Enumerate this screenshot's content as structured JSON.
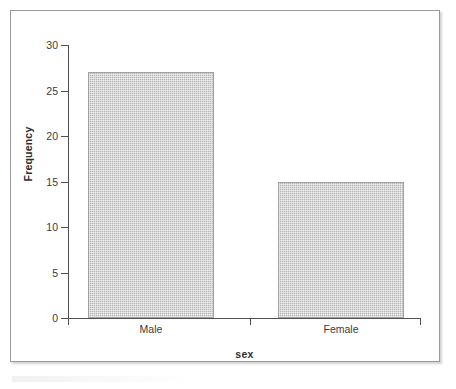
{
  "figure": {
    "background_color": "#ffffff",
    "border_color": "#9a9a9a"
  },
  "chart_data": {
    "type": "bar",
    "title": "",
    "subtitle": "",
    "xlabel": "sex",
    "ylabel": "Frequency",
    "categories": [
      "Male",
      "Female"
    ],
    "values": [
      27,
      15
    ],
    "ylim": [
      0,
      30
    ],
    "ytick_labels": [
      "0",
      "5",
      "10",
      "15",
      "20",
      "25",
      "30"
    ],
    "ytick_values": [
      0,
      5,
      10,
      15,
      20,
      25,
      30
    ],
    "grid": false,
    "legend": false,
    "legend_position": "none",
    "bar_fill_color": "#b4b4b4",
    "bar_edge_color": "#a2a2a2",
    "axis_color": "#4f4f4f",
    "annotations": []
  }
}
